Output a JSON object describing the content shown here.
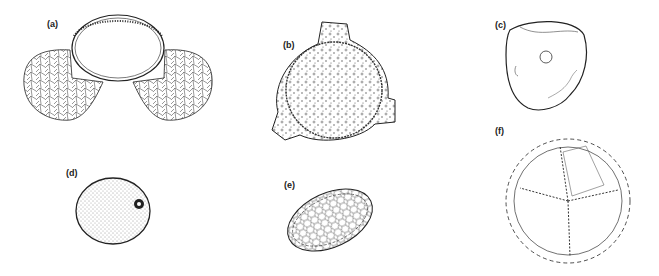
{
  "figure": {
    "panels": [
      {
        "id": "a",
        "label": "(a)",
        "description": "bisaccate pollen grain with central body and two reticulate air sacs"
      },
      {
        "id": "b",
        "label": "(b)",
        "description": "triporate pollen grain with granular/punctate surface"
      },
      {
        "id": "c",
        "label": "(c)",
        "description": "smooth subangular grain with single pore"
      },
      {
        "id": "d",
        "label": "(d)",
        "description": "spherical stippled grain with single annulate pore"
      },
      {
        "id": "e",
        "label": "(e)",
        "description": "ellipsoidal reticulate grain with furrow"
      },
      {
        "id": "f",
        "label": "(f)",
        "description": "spiny echinate spore with trilete/tetrad marks"
      }
    ],
    "colors": {
      "ink": "#222222",
      "background": "#ffffff"
    }
  }
}
